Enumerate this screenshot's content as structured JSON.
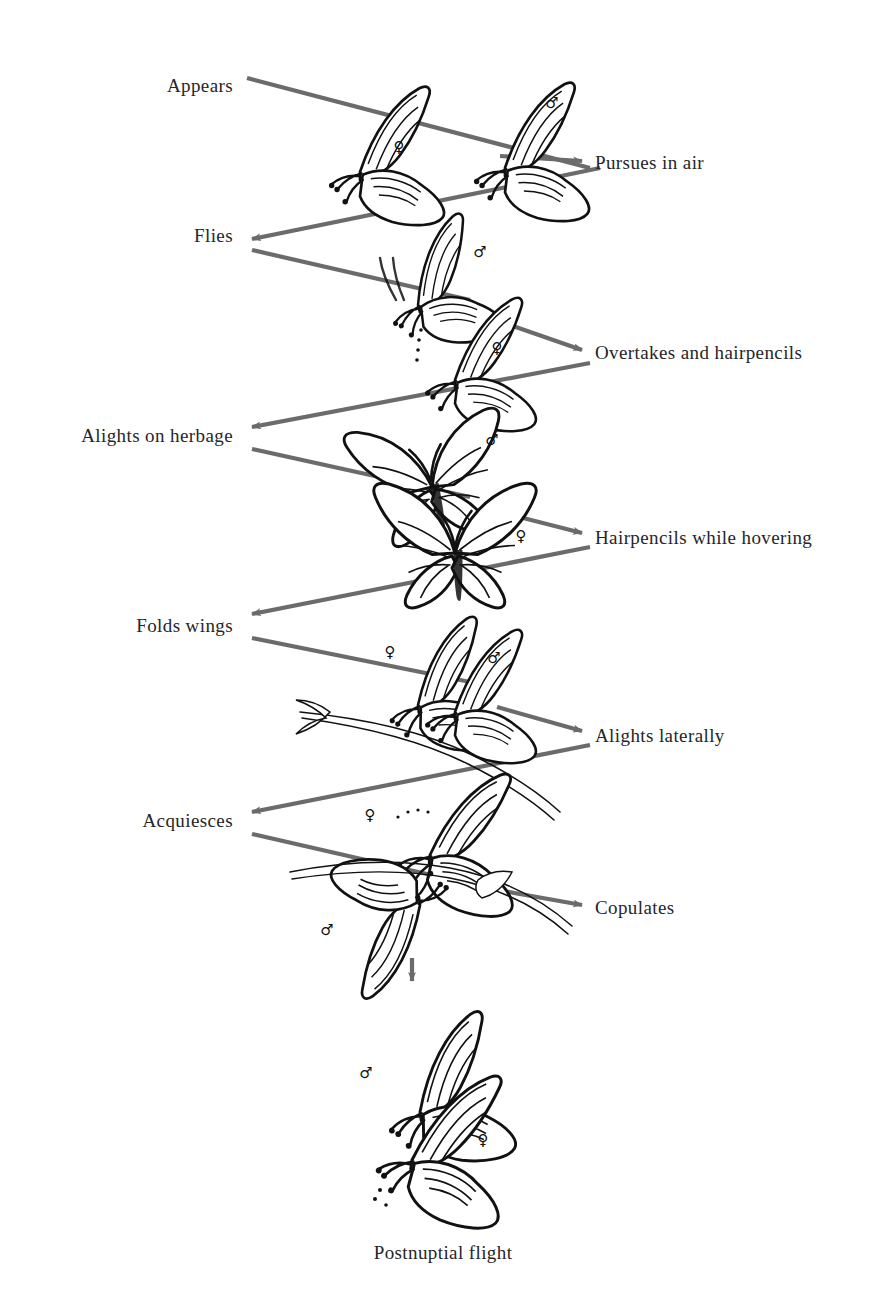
{
  "figure": {
    "caption": "Postnuptial flight",
    "arrow_color": "#6b6b6b",
    "ink_color": "#111111",
    "background": "#ffffff",
    "symbols": {
      "male": "♂",
      "female": "♀"
    }
  },
  "steps": [
    {
      "id": "appears",
      "side": "left",
      "label": "Appears",
      "x": 233,
      "y": 85
    },
    {
      "id": "pursues",
      "side": "right",
      "label": "Pursues in air",
      "x": 595,
      "y": 162
    },
    {
      "id": "flies",
      "side": "left",
      "label": "Flies",
      "x": 233,
      "y": 235
    },
    {
      "id": "overtakes",
      "side": "right",
      "label": "Overtakes and hairpencils",
      "x": 595,
      "y": 352
    },
    {
      "id": "alights_herb",
      "side": "left",
      "label": "Alights on herbage",
      "x": 233,
      "y": 435
    },
    {
      "id": "hairpencils",
      "side": "right",
      "label": "Hairpencils while hovering",
      "x": 595,
      "y": 537
    },
    {
      "id": "folds_wings",
      "side": "left",
      "label": "Folds wings",
      "x": 233,
      "y": 625
    },
    {
      "id": "alights_lat",
      "side": "right",
      "label": "Alights laterally",
      "x": 595,
      "y": 735
    },
    {
      "id": "acquiesces",
      "side": "left",
      "label": "Acquiesces",
      "x": 233,
      "y": 820
    },
    {
      "id": "copulates",
      "side": "right",
      "label": "Copulates",
      "x": 595,
      "y": 907
    }
  ],
  "caption_block": {
    "label": "Postnuptial flight",
    "x": 443,
    "y": 1252
  },
  "scenes": [
    {
      "id": "scene-1-pursuit",
      "sexes": [
        "female",
        "male"
      ]
    },
    {
      "id": "scene-2-overtake",
      "sexes": [
        "male",
        "female"
      ]
    },
    {
      "id": "scene-3-hovering",
      "sexes": [
        "male",
        "female"
      ]
    },
    {
      "id": "scene-4-lateral",
      "sexes": [
        "female",
        "male"
      ]
    },
    {
      "id": "scene-5-copulation",
      "sexes": [
        "female",
        "male"
      ]
    },
    {
      "id": "scene-6-postnuptial",
      "sexes": [
        "male",
        "female"
      ]
    }
  ],
  "sex_markers": [
    {
      "sex": "female",
      "x": 399,
      "y": 147
    },
    {
      "sex": "male",
      "x": 552,
      "y": 103
    },
    {
      "sex": "male",
      "x": 480,
      "y": 252
    },
    {
      "sex": "female",
      "x": 497,
      "y": 348
    },
    {
      "sex": "male",
      "x": 492,
      "y": 440
    },
    {
      "sex": "female",
      "x": 521,
      "y": 536
    },
    {
      "sex": "female",
      "x": 390,
      "y": 652
    },
    {
      "sex": "male",
      "x": 494,
      "y": 658
    },
    {
      "sex": "female",
      "x": 370,
      "y": 815
    },
    {
      "sex": "male",
      "x": 327,
      "y": 930
    },
    {
      "sex": "male",
      "x": 366,
      "y": 1073
    },
    {
      "sex": "female",
      "x": 483,
      "y": 1140
    }
  ]
}
